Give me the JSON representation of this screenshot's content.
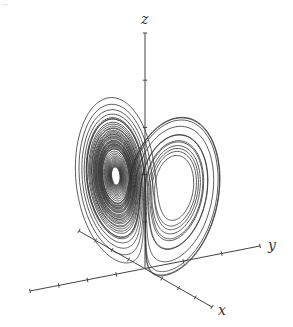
{
  "figure": {
    "caption_fragment": "...",
    "axes": {
      "x_label": "x",
      "y_label": "y",
      "z_label": "z",
      "origin_px": [
        145,
        269
      ],
      "z_axis_top_px": [
        145,
        33
      ],
      "y_axis_end_px": [
        260,
        246
      ],
      "y_axis_neg_end_px": [
        30,
        291
      ],
      "x_axis_end_px": [
        212,
        307
      ],
      "x_axis_neg_end_px": [
        79,
        231
      ],
      "tick_marks": true
    },
    "attractor": {
      "system": "Lorenz",
      "sigma": 10,
      "rho": 28,
      "beta": 2.6667,
      "stroke_color": "#333333",
      "left_wing_hole_center_px": [
        95,
        130
      ],
      "right_wing_hole_center_px": [
        197,
        145
      ]
    },
    "colors": {
      "background": "#ffffff",
      "line": "#333333",
      "axis": "#444444"
    }
  }
}
